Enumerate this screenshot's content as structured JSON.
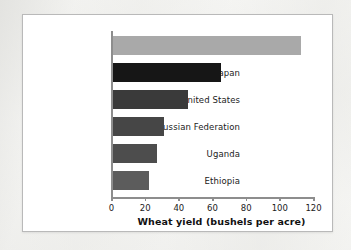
{
  "chart_data": {
    "type": "bar",
    "orientation": "horizontal",
    "title": "",
    "xlabel": "Wheat yield (bushels per acre)",
    "ylabel": "",
    "xlim": [
      0,
      120
    ],
    "xticks": [
      0,
      20,
      40,
      60,
      80,
      100,
      120
    ],
    "grid": false,
    "legend": "none",
    "categories": [
      "France",
      "Japan",
      "United States",
      "Russian Federation",
      "Uganda",
      "Ethiopia"
    ],
    "values": [
      112,
      65,
      45,
      31,
      27,
      22
    ],
    "bar_colors": [
      "#a9a9a9",
      "#161616",
      "#3a3a3a",
      "#464646",
      "#4d4d4d",
      "#5c5c5c"
    ],
    "bars": [
      {
        "label": "France",
        "value": 112,
        "color": "#a9a9a9"
      },
      {
        "label": "Japan",
        "value": 65,
        "color": "#161616"
      },
      {
        "label": "United States",
        "value": 45,
        "color": "#3a3a3a"
      },
      {
        "label": "Russian Federation",
        "value": 31,
        "color": "#464646"
      },
      {
        "label": "Uganda",
        "value": 27,
        "color": "#4d4d4d"
      },
      {
        "label": "Ethiopia",
        "value": 22,
        "color": "#5c5c5c"
      }
    ],
    "axis_color": "#8d8d8d",
    "plot_background": "#ffffff",
    "frame_border_color": "#b9b9b9"
  },
  "ticks": {
    "t0": "0",
    "t1": "20",
    "t2": "40",
    "t3": "60",
    "t4": "80",
    "t5": "100",
    "t6": "120"
  }
}
